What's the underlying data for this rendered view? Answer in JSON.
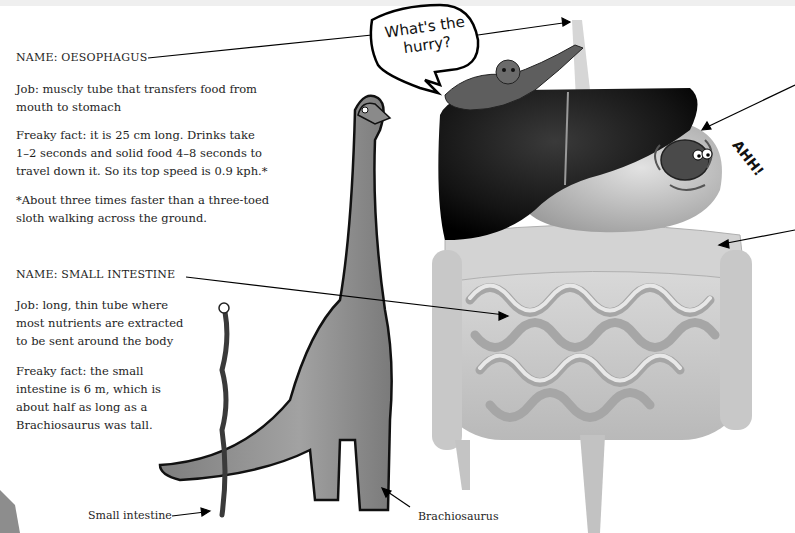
{
  "oesophagus": {
    "name": "NAME: OESOPHAGUS",
    "job": "Job: muscly tube that transfers food from mouth to stomach",
    "job_lines": [
      "Job: muscly tube that transfers food from",
      "mouth to stomach"
    ],
    "fact_lines": [
      "Freaky fact: it is 25 cm long. Drinks take",
      "1–2 seconds and solid food 4–8 seconds to",
      "travel down it. So its top speed is 0.9 kph.*"
    ],
    "footnote_lines": [
      "*About three times faster than a three-toed",
      "sloth walking across the ground."
    ]
  },
  "small_intestine": {
    "name": "NAME: SMALL INTESTINE",
    "job_lines": [
      "Job: long, thin tube where",
      "most nutrients are extracted",
      "to be sent around the body"
    ],
    "fact_lines": [
      "Freaky fact: the small",
      "intestine is 6 m, which is",
      "about half as long as a",
      "Brachiosaurus was tall."
    ]
  },
  "speech_bubble": {
    "lines": [
      "What's the",
      "hurry?"
    ]
  },
  "exclamation": "AHH!",
  "captions": {
    "small_intestine": "Small intestine",
    "brachiosaurus": "Brachiosaurus"
  },
  "colors": {
    "ink": "#1e1e1e",
    "liver": "#1b1b1b",
    "organ_light": "#cfcfcf",
    "dino": "#8f8f8f"
  }
}
